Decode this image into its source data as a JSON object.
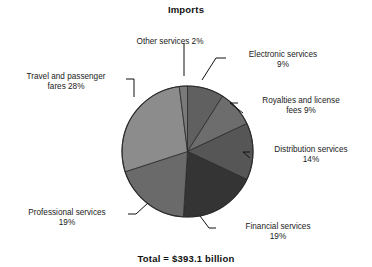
{
  "chart_data": {
    "type": "pie",
    "title": "Imports",
    "subtitle": "",
    "xlabel": "",
    "ylabel": "",
    "total_label": "Total = $393.1 billion",
    "total_value": 393.1,
    "total_units": "billion dollars",
    "units": "percent",
    "legend": "none (labels placed outside slices with leader lines)",
    "grid": false,
    "start_angle_deg": 0,
    "direction": "clockwise",
    "categories": [
      "Electronic services",
      "Royalties and license fees",
      "Distribution services",
      "Financial services",
      "Professional services",
      "Travel and passenger fares",
      "Other services"
    ],
    "values": [
      9,
      9,
      14,
      19,
      19,
      28,
      2
    ],
    "colors": [
      "#606060",
      "#6d6d6d",
      "#565656",
      "#343434",
      "#6a6a6a",
      "#8c8c8c",
      "#7a7a7a"
    ],
    "slices": [
      {
        "label": "Electronic services",
        "percent": 9,
        "percent_text": "9%",
        "label_text": "Electronic services 9%",
        "color": "#606060"
      },
      {
        "label": "Royalties and license fees",
        "percent": 9,
        "percent_text": "9%",
        "label_text": "Royalties and license fees 9%",
        "color": "#6d6d6d"
      },
      {
        "label": "Distribution services",
        "percent": 14,
        "percent_text": "14%",
        "label_text": "Distribution services 14%",
        "color": "#565656"
      },
      {
        "label": "Financial services",
        "percent": 19,
        "percent_text": "19%",
        "label_text": "Financial services 19%",
        "color": "#343434"
      },
      {
        "label": "Professional services",
        "percent": 19,
        "percent_text": "19%",
        "label_text": "Professional services 19%",
        "color": "#6a6a6a"
      },
      {
        "label": "Travel and passenger fares",
        "percent": 28,
        "percent_text": "28%",
        "label_text": "Travel and passenger fares 28%",
        "color": "#8c8c8c"
      },
      {
        "label": "Other services",
        "percent": 2,
        "percent_text": "2%",
        "label_text": "Other services 2%",
        "color": "#7a7a7a"
      }
    ]
  },
  "labels": {
    "other_services": "Other services 2%",
    "electronic_line1": "Electronic services",
    "electronic_line2": "9%",
    "royalties_line1": "Royalties and license",
    "royalties_line2": "fees 9%",
    "distribution_line1": "Distribution services",
    "distribution_line2": "14%",
    "financial_line1": "Financial services",
    "financial_line2": "19%",
    "professional_line1": "Professional services",
    "professional_line2": "19%",
    "travel_line1": "Travel and passenger",
    "travel_line2": "fares 28%"
  }
}
